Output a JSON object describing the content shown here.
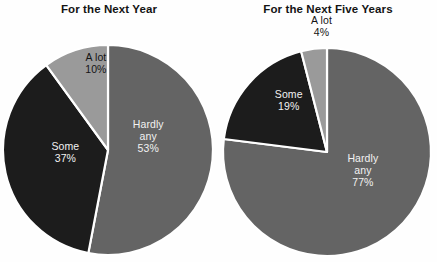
{
  "background": "#ffffff",
  "colors": {
    "hardly_any": "#646464",
    "some": "#1c1c1c",
    "a_lot": "#9a9a9a",
    "divider": "#ffffff",
    "label_on_dark": "#f2f2f2",
    "label_on_light": "#141414",
    "title": "#141414"
  },
  "chart_data": [
    {
      "type": "pie",
      "title": "For the Next Year",
      "categories": [
        "Hardly any",
        "Some",
        "A lot"
      ],
      "values": [
        53,
        37,
        10
      ],
      "value_labels": [
        "53%",
        "37%",
        "10%"
      ],
      "unit": "%",
      "legend": "none",
      "labels_inline": true,
      "start_angle_deg": 0,
      "direction": "clockwise",
      "slices": [
        {
          "name": "Hardly any",
          "name_line1": "Hardly",
          "name_line2": "any",
          "value": 53,
          "value_label": "53%",
          "color": "#646464",
          "label_color": "on-dark",
          "label_x_pct": 68,
          "label_y_pct": 52
        },
        {
          "name": "Some",
          "name_line1": "Some",
          "name_line2": "",
          "value": 37,
          "value_label": "37%",
          "color": "#1c1c1c",
          "label_color": "on-dark",
          "label_x_pct": 30,
          "label_y_pct": 58
        },
        {
          "name": "A lot",
          "name_line1": "A lot",
          "name_line2": "",
          "value": 10,
          "value_label": "10%",
          "color": "#9a9a9a",
          "label_color": "on-light",
          "label_x_pct": 44,
          "label_y_pct": 24
        }
      ]
    },
    {
      "type": "pie",
      "title": "For the Next Five Years",
      "categories": [
        "Hardly any",
        "Some",
        "A lot"
      ],
      "values": [
        77,
        19,
        4
      ],
      "value_labels": [
        "77%",
        "19%",
        "4%"
      ],
      "unit": "%",
      "legend": "none",
      "labels_inline": true,
      "start_angle_deg": 0,
      "direction": "clockwise",
      "slices": [
        {
          "name": "Hardly any",
          "name_line1": "Hardly",
          "name_line2": "any",
          "value": 77,
          "value_label": "77%",
          "color": "#646464",
          "label_color": "on-dark",
          "label_x_pct": 66,
          "label_y_pct": 65
        },
        {
          "name": "Some",
          "name_line1": "Some",
          "name_line2": "",
          "value": 19,
          "value_label": "19%",
          "color": "#1c1c1c",
          "label_color": "on-dark",
          "label_x_pct": 32,
          "label_y_pct": 38
        },
        {
          "name": "A lot",
          "name_line1": "A lot",
          "name_line2": "",
          "value": 4,
          "value_label": "4%",
          "color": "#9a9a9a",
          "label_color": "outside",
          "label_x_pct": 47,
          "label_y_pct": 10
        }
      ]
    }
  ]
}
